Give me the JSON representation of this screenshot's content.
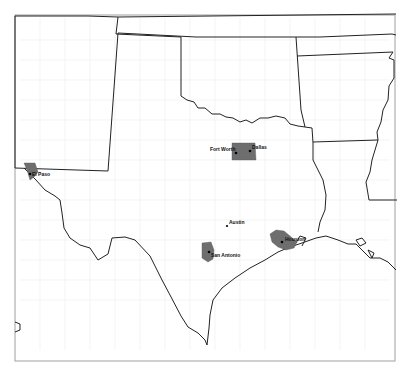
{
  "map": {
    "region": "Texas and surrounding states",
    "colors": {
      "background": "#ffffff",
      "state_border": "#222222",
      "county_border": "#e6e6e6",
      "metro_fill": "#6e6e6e",
      "frame": "#999999",
      "city_dot": "#000000"
    },
    "cities": [
      {
        "name": "Fort Worth",
        "x": 236,
        "y": 153,
        "label_x": 210,
        "label_y": 150
      },
      {
        "name": "Dallas",
        "x": 250,
        "y": 151,
        "label_x": 252,
        "label_y": 147
      },
      {
        "name": "El Paso",
        "x": 30,
        "y": 174,
        "label_x": 32,
        "label_y": 175
      },
      {
        "name": "Austin",
        "x": 227,
        "y": 226,
        "label_x": 229,
        "label_y": 222
      },
      {
        "name": "San Antonio",
        "x": 209,
        "y": 252,
        "label_x": 211,
        "label_y": 256
      },
      {
        "name": "Houston",
        "x": 282,
        "y": 242,
        "label_x": 285,
        "label_y": 240
      }
    ],
    "top_text_fragment": "...py..g..."
  }
}
